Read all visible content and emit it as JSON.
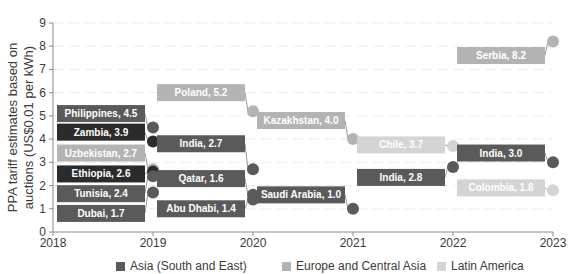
{
  "chart_data": {
    "type": "scatter",
    "title": "",
    "xlabel": "",
    "ylabel": "PPA tariff estimates based on auctions (US$0.01 per kWh)",
    "ylabel_lines": [
      "PPA tariff estimates based on",
      "auctions (US$0.01 per kWh)"
    ],
    "xlim": [
      2018,
      2023
    ],
    "ylim": [
      0,
      9
    ],
    "x_ticks": [
      2018,
      2019,
      2020,
      2021,
      2022,
      2023
    ],
    "y_ticks": [
      0,
      1,
      2,
      3,
      4,
      5,
      6,
      7,
      8,
      9
    ],
    "grid": true,
    "legend_position": "bottom",
    "series": [
      {
        "name": "Asia (South and East)",
        "color": "#5a5a5a"
      },
      {
        "name": "Europe and Central Asia",
        "color": "#b3b3b3"
      },
      {
        "name": "Latin America",
        "color": "#d4d4d4"
      },
      {
        "name": "Africa",
        "color": "#2b2b2b",
        "in_legend": false
      }
    ],
    "points": [
      {
        "label": "Philippines",
        "x": 2019,
        "y": 4.5,
        "series": "Asia (South and East)",
        "text": "Philippines, 4.5",
        "label_y": 5.1,
        "side": "left"
      },
      {
        "label": "Zambia",
        "x": 2019,
        "y": 3.9,
        "series": "Africa",
        "text": "Zambia, 3.9",
        "label_y": 4.3,
        "side": "left"
      },
      {
        "label": "Uzbekistan",
        "x": 2019,
        "y": 2.7,
        "series": "Europe and Central Asia",
        "text": "Uzbekistan, 2.7",
        "label_y": 3.4,
        "side": "left"
      },
      {
        "label": "Ethiopia",
        "x": 2019,
        "y": 2.6,
        "series": "Africa",
        "text": "Ethiopia, 2.6",
        "label_y": 2.5,
        "side": "left"
      },
      {
        "label": "Tunisia",
        "x": 2019,
        "y": 2.4,
        "series": "Asia (South and East)",
        "text": "Tunisia, 2.4",
        "label_y": 1.65,
        "side": "left"
      },
      {
        "label": "Dubai",
        "x": 2019,
        "y": 1.7,
        "series": "Asia (South and East)",
        "text": "Dubai, 1.7",
        "label_y": 0.8,
        "side": "left"
      },
      {
        "label": "Poland",
        "x": 2020,
        "y": 5.2,
        "series": "Europe and Central Asia",
        "text": "Poland, 5.2",
        "label_y": 6.0,
        "side": "left"
      },
      {
        "label": "India",
        "x": 2020,
        "y": 2.7,
        "series": "Asia (South and East)",
        "text": "India, 2.7",
        "label_y": 3.8,
        "side": "left"
      },
      {
        "label": "Qatar",
        "x": 2020,
        "y": 1.6,
        "series": "Asia (South and East)",
        "text": "Qatar, 1.6",
        "label_y": 2.3,
        "side": "left"
      },
      {
        "label": "Abu Dhabi",
        "x": 2020,
        "y": 1.4,
        "series": "Asia (South and East)",
        "text": "Abu Dhabi, 1.4",
        "label_y": 1.0,
        "side": "left"
      },
      {
        "label": "Kazakhstan",
        "x": 2021,
        "y": 4.0,
        "series": "Europe and Central Asia",
        "text": "Kazakhstan, 4.0",
        "label_y": 4.8,
        "side": "left"
      },
      {
        "label": "Saudi Arabia",
        "x": 2021,
        "y": 1.0,
        "series": "Asia (South and East)",
        "text": "Saudi Arabia, 1.0",
        "label_y": 1.6,
        "side": "left"
      },
      {
        "label": "Chile",
        "x": 2022,
        "y": 3.7,
        "series": "Latin America",
        "text": "Chile, 3.7",
        "label_y": 3.75,
        "side": "left"
      },
      {
        "label": "India",
        "x": 2022,
        "y": 2.8,
        "series": "Asia (South and East)",
        "text": "India, 2.8",
        "label_y": 2.35,
        "side": "left"
      },
      {
        "label": "Serbia",
        "x": 2023,
        "y": 8.2,
        "series": "Europe and Central Asia",
        "text": "Serbia, 8.2",
        "label_y": 7.6,
        "side": "left"
      },
      {
        "label": "India",
        "x": 2023,
        "y": 3.0,
        "series": "Asia (South and East)",
        "text": "India, 3.0",
        "label_y": 3.4,
        "side": "left"
      },
      {
        "label": "Colombia",
        "x": 2023,
        "y": 1.8,
        "series": "Latin America",
        "text": "Colombia, 1.8",
        "label_y": 1.9,
        "side": "left"
      }
    ]
  }
}
